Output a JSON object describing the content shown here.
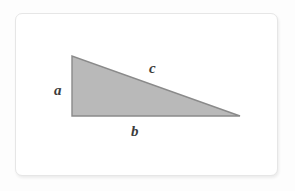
{
  "figure": {
    "name": "right-triangle-diagram",
    "caption": "",
    "canvas": {
      "width": 295,
      "height": 191,
      "background_color": "#fdfdfd"
    },
    "card": {
      "background_color": "#ffffff",
      "border_color": "#e6e6e6",
      "corner_radius": 7
    },
    "shape": {
      "type": "right-triangle",
      "fill_color": "#b9b9b9",
      "stroke_color": "#8a8a8a",
      "stroke_width": 1.4,
      "vertices": {
        "apex_top_left": [
          72,
          56
        ],
        "right_angle_bottom_left": [
          72,
          116
        ],
        "bottom_right": [
          240,
          116
        ]
      },
      "right_angle_at": "bottom-left"
    },
    "labels": {
      "side_a": {
        "text": "a",
        "edge": "vertical-left-leg",
        "position": [
          54,
          83
        ],
        "color": "#3c3c3c",
        "style": "bold-italic-serif"
      },
      "side_b": {
        "text": "b",
        "edge": "horizontal-bottom-leg",
        "position": [
          131,
          124
        ],
        "color": "#3c3c3c",
        "style": "bold-italic-serif"
      },
      "side_c": {
        "text": "c",
        "edge": "hypotenuse",
        "position": [
          149,
          61
        ],
        "color": "#3c3c3c",
        "style": "bold-italic-serif"
      }
    }
  }
}
